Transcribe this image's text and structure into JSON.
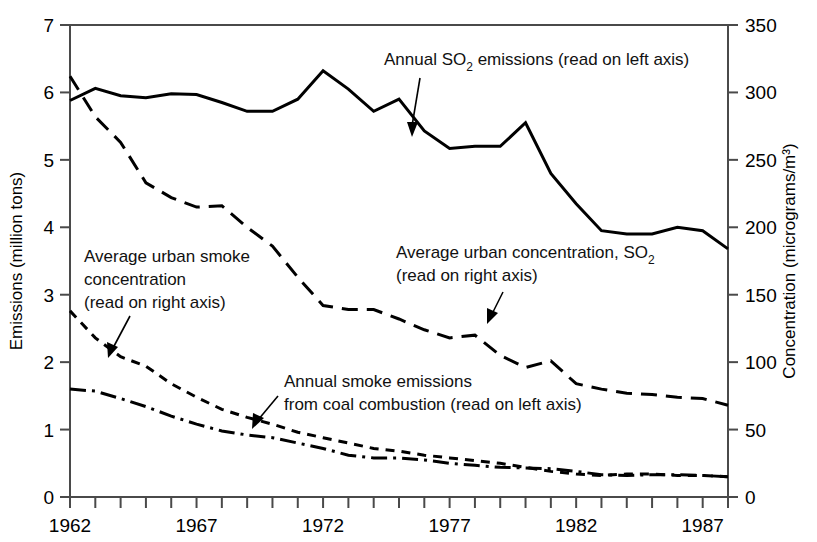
{
  "chart_data": {
    "type": "line",
    "title": "",
    "xlabel": "",
    "ylabel": "Emissions (million tons)",
    "y2label": "Concentration (micrograms/m³)",
    "grid": false,
    "legend_position": "inline-annotations",
    "xlim": [
      1962,
      1988
    ],
    "ylim": [
      0,
      7
    ],
    "y2lim": [
      0,
      350
    ],
    "x_tick_labels": [
      "1962",
      "1967",
      "1972",
      "1977",
      "1982",
      "1987"
    ],
    "x_tick_values": [
      1962,
      1967,
      1972,
      1977,
      1982,
      1987
    ],
    "x_minor_ticks": [
      1963,
      1964,
      1965,
      1966,
      1968,
      1969,
      1970,
      1971,
      1973,
      1974,
      1975,
      1976,
      1978,
      1979,
      1980,
      1981,
      1983,
      1984,
      1985,
      1986,
      1988
    ],
    "y_tick_labels": [
      "0",
      "1",
      "2",
      "3",
      "4",
      "5",
      "6",
      "7"
    ],
    "y_tick_values": [
      0,
      1,
      2,
      3,
      4,
      5,
      6,
      7
    ],
    "y2_tick_labels": [
      "0",
      "50",
      "100",
      "150",
      "200",
      "250",
      "300",
      "350"
    ],
    "y2_tick_values": [
      0,
      50,
      100,
      150,
      200,
      250,
      300,
      350
    ],
    "x": [
      1962,
      1963,
      1964,
      1965,
      1966,
      1967,
      1968,
      1969,
      1970,
      1971,
      1972,
      1973,
      1974,
      1975,
      1976,
      1977,
      1978,
      1979,
      1980,
      1981,
      1982,
      1983,
      1984,
      1985,
      1986,
      1987,
      1988
    ],
    "series": [
      {
        "name": "Annual SO2 emissions (read on left axis)",
        "axis": "left",
        "style": "solid",
        "units": "million tons",
        "values": [
          5.88,
          6.06,
          5.95,
          5.92,
          5.98,
          5.97,
          5.85,
          5.72,
          5.72,
          5.9,
          6.32,
          6.05,
          5.72,
          5.9,
          5.43,
          5.17,
          5.2,
          5.2,
          5.55,
          4.8,
          4.35,
          3.95,
          3.9,
          3.9,
          4.0,
          3.95,
          3.68
        ]
      },
      {
        "name": "Average urban concentration, SO2 (read on right axis)",
        "axis": "right",
        "style": "long-dash",
        "units": "micrograms/m3",
        "values": [
          312,
          282,
          263,
          233,
          222,
          215,
          216,
          200,
          186,
          163,
          142,
          139,
          139,
          132,
          124,
          118,
          120,
          105,
          96,
          101,
          84,
          80,
          77,
          76,
          74,
          73,
          68
        ]
      },
      {
        "name": "Average urban smoke concentration (read on right axis)",
        "axis": "right",
        "style": "short-dash",
        "units": "micrograms/m3",
        "values": [
          138,
          118,
          104,
          97,
          84,
          74,
          65,
          59,
          54,
          48,
          44,
          40,
          36,
          34,
          31,
          29,
          27,
          25,
          22,
          19,
          17,
          16,
          17,
          17,
          16,
          16,
          15
        ]
      },
      {
        "name": "Annual smoke emissions from coal combustion (read on left axis)",
        "axis": "left",
        "style": "dash-dot",
        "units": "million tons",
        "values": [
          1.6,
          1.57,
          1.46,
          1.34,
          1.2,
          1.08,
          0.98,
          0.92,
          0.88,
          0.8,
          0.72,
          0.62,
          0.58,
          0.58,
          0.55,
          0.5,
          0.47,
          0.44,
          0.43,
          0.42,
          0.38,
          0.33,
          0.32,
          0.33,
          0.33,
          0.32,
          0.3
        ]
      }
    ],
    "annotations": [
      {
        "id": "so2-emissions",
        "lines": [
          "Annual SO",
          "2",
          " emissions (read on left axis)"
        ],
        "text": "Annual SO2 emissions (read on left axis)"
      },
      {
        "id": "urban-smoke-concentration",
        "line1": "Average urban smoke",
        "line2": "concentration",
        "line3": "(read on right axis)"
      },
      {
        "id": "urban-so2-concentration",
        "line1_a": "Average urban concentration, SO",
        "line1_sub": "2",
        "line2": "(read on right axis)"
      },
      {
        "id": "smoke-emissions-coal",
        "line1": "Annual smoke emissions",
        "line2": "from coal combustion (read on left axis)"
      }
    ],
    "colors": {
      "line": "#000000",
      "axis": "#4a4a4a",
      "text": "#000000",
      "background": "#ffffff"
    }
  }
}
